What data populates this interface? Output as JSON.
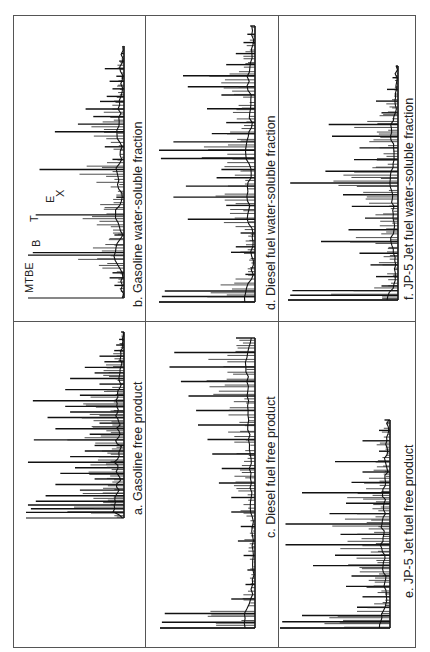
{
  "figure": {
    "layout": "3 columns x 2 rows, page rotated 90 degrees counterclockwise; retention time runs bottom-to-top, detector response extends leftward from a vertical baseline",
    "panels": [
      {
        "id": "a",
        "label": "a.  Gasoline free product",
        "fuel": "Gasoline",
        "fraction": "free product"
      },
      {
        "id": "b",
        "label": "b.  Gasoline water-soluble fraction",
        "fuel": "Gasoline",
        "fraction": "water-soluble fraction"
      },
      {
        "id": "c",
        "label": "c.  Diesel fuel free product",
        "fuel": "Diesel fuel",
        "fraction": "free product"
      },
      {
        "id": "d",
        "label": "d.  Diesel fuel water-soluble fraction",
        "fuel": "Diesel fuel",
        "fraction": "water-soluble fraction"
      },
      {
        "id": "e",
        "label": "e.  JP-5 Jet fuel free product",
        "fuel": "JP-5 Jet fuel",
        "fraction": "free product"
      },
      {
        "id": "f",
        "label": "f.  JP-5 Jet fuel water-soluble fraction",
        "fuel": "JP-5 Jet fuel",
        "fraction": "water-soluble fraction"
      }
    ],
    "peak_annotations": {
      "panel": "b",
      "labels": [
        "MTBE",
        "B",
        "T",
        "E",
        "X"
      ]
    }
  },
  "chart_data": [
    {
      "type": "line",
      "panel": "a",
      "title": "Gasoline free product",
      "xlabel": "",
      "ylabel": "",
      "note": "Gas chromatogram; x = relative retention position (0=start,1=end), y = relative peak intensity",
      "x": [
        0.0,
        0.03,
        0.05,
        0.07,
        0.09,
        0.12,
        0.15,
        0.18,
        0.21,
        0.24,
        0.27,
        0.3,
        0.33,
        0.36,
        0.39,
        0.42,
        0.45,
        0.48,
        0.51,
        0.54,
        0.57,
        0.6,
        0.63,
        0.66,
        0.69,
        0.72,
        0.75,
        0.78,
        0.81,
        0.84,
        0.87,
        0.9,
        0.93,
        0.96,
        1.0
      ],
      "y": [
        0.02,
        1.0,
        0.95,
        0.98,
        0.9,
        0.8,
        0.45,
        0.7,
        0.3,
        0.65,
        0.5,
        0.98,
        0.55,
        0.4,
        0.3,
        0.92,
        0.35,
        0.7,
        0.25,
        0.78,
        0.55,
        0.6,
        0.93,
        0.45,
        0.6,
        0.25,
        0.55,
        0.3,
        0.4,
        0.2,
        0.25,
        0.1,
        0.08,
        0.05,
        0.03
      ]
    },
    {
      "type": "line",
      "panel": "b",
      "title": "Gasoline water-soluble fraction",
      "xlabel": "",
      "ylabel": "",
      "peak_labels": {
        "MTBE": 0.17,
        "B": 0.33,
        "T": 0.51,
        "E": 0.66,
        "X": 0.69
      },
      "x": [
        0.0,
        0.05,
        0.08,
        0.1,
        0.17,
        0.18,
        0.25,
        0.33,
        0.4,
        0.51,
        0.55,
        0.6,
        0.66,
        0.69,
        0.72,
        0.75,
        0.78,
        0.8,
        0.83,
        0.86,
        0.88,
        0.91,
        0.94,
        0.97,
        1.0
      ],
      "y": [
        0.02,
        0.1,
        0.15,
        0.12,
        1.0,
        0.95,
        0.1,
        0.92,
        0.08,
        0.88,
        0.12,
        0.2,
        0.72,
        0.48,
        0.32,
        0.4,
        0.25,
        0.18,
        0.12,
        0.15,
        0.08,
        0.2,
        0.05,
        0.03,
        0.01
      ]
    },
    {
      "type": "line",
      "panel": "c",
      "title": "Diesel fuel free product",
      "xlabel": "",
      "ylabel": "",
      "x": [
        0.0,
        0.02,
        0.05,
        0.1,
        0.15,
        0.2,
        0.25,
        0.3,
        0.35,
        0.4,
        0.45,
        0.5,
        0.55,
        0.6,
        0.65,
        0.7,
        0.75,
        0.8,
        0.85,
        0.9,
        0.95,
        1.0
      ],
      "y": [
        1.0,
        0.98,
        0.95,
        0.25,
        0.1,
        0.08,
        0.12,
        0.18,
        0.15,
        0.25,
        0.25,
        0.38,
        0.35,
        0.45,
        0.5,
        0.6,
        0.62,
        0.7,
        0.78,
        0.9,
        0.85,
        0.2
      ],
      "background_hump": "unresolved complex mixture rising toward late retention"
    },
    {
      "type": "line",
      "panel": "d",
      "title": "Diesel fuel water-soluble fraction",
      "xlabel": "",
      "ylabel": "",
      "x": [
        0.0,
        0.02,
        0.04,
        0.1,
        0.18,
        0.2,
        0.25,
        0.3,
        0.35,
        0.38,
        0.42,
        0.45,
        0.48,
        0.52,
        0.55,
        0.58,
        0.61,
        0.65,
        0.7,
        0.75,
        0.78,
        0.82,
        0.86,
        0.9,
        0.94,
        0.97,
        1.0
      ],
      "y": [
        1.0,
        0.97,
        0.94,
        0.1,
        0.25,
        0.2,
        0.15,
        0.7,
        0.3,
        0.85,
        0.72,
        0.4,
        0.35,
        0.98,
        1.0,
        0.85,
        0.45,
        0.3,
        0.5,
        0.35,
        0.7,
        0.75,
        0.3,
        0.2,
        0.12,
        0.08,
        0.05
      ]
    },
    {
      "type": "line",
      "panel": "e",
      "title": "JP-5 Jet fuel free product",
      "xlabel": "",
      "ylabel": "",
      "x": [
        0.0,
        0.03,
        0.06,
        0.1,
        0.15,
        0.2,
        0.25,
        0.3,
        0.35,
        0.4,
        0.45,
        0.5,
        0.55,
        0.6,
        0.65,
        0.7,
        0.75,
        0.8,
        0.85,
        0.9,
        0.95,
        1.0
      ],
      "y": [
        1.0,
        0.98,
        0.8,
        0.3,
        0.25,
        0.4,
        0.35,
        0.7,
        0.5,
        0.95,
        0.45,
        0.95,
        0.55,
        0.4,
        0.8,
        0.35,
        0.25,
        0.5,
        0.1,
        0.25,
        0.1,
        0.05
      ]
    },
    {
      "type": "line",
      "panel": "f",
      "title": "JP-5 Jet fuel water-soluble fraction",
      "xlabel": "",
      "ylabel": "",
      "x": [
        0.0,
        0.02,
        0.04,
        0.06,
        0.1,
        0.15,
        0.2,
        0.25,
        0.3,
        0.35,
        0.4,
        0.45,
        0.5,
        0.55,
        0.6,
        0.65,
        0.7,
        0.75,
        0.8,
        0.85,
        0.9,
        0.95,
        1.0
      ],
      "y": [
        1.0,
        0.98,
        0.96,
        0.15,
        0.2,
        0.25,
        0.35,
        0.7,
        0.45,
        0.3,
        0.42,
        0.5,
        0.98,
        0.66,
        0.4,
        0.35,
        0.6,
        0.63,
        0.15,
        0.2,
        0.1,
        0.05,
        0.02
      ]
    }
  ]
}
